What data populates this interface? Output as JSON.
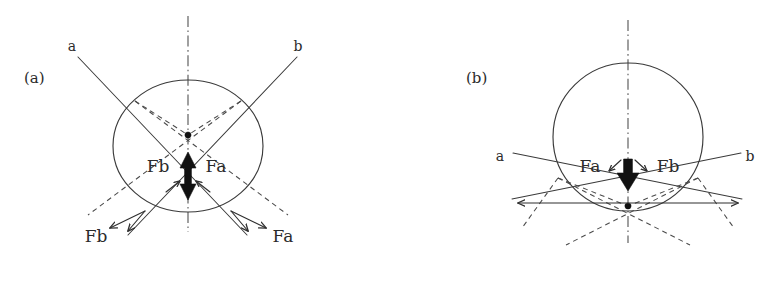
{
  "figure": {
    "background_color": "#ffffff",
    "ink_color": "#3a3a3a",
    "bold_ink_color": "#111111",
    "width": 769,
    "height": 282
  },
  "panels": [
    {
      "id": "panel-a",
      "tag": "(a)",
      "tag_position": {
        "x": 24,
        "y": 83
      },
      "circle": {
        "cx": 188,
        "cy": 146,
        "r": 66
      },
      "axis_label": "vertical-dash-dot-axis",
      "rays": [
        {
          "name": "ray-a",
          "label": "a",
          "label_position": {
            "x": 72,
            "y": 51
          }
        },
        {
          "name": "ray-b",
          "label": "b",
          "label_position": {
            "x": 298,
            "y": 51
          }
        }
      ],
      "center_forces": [
        {
          "name": "force-fb-center",
          "label": "Fb",
          "label_position": {
            "x": 158,
            "y": 172
          }
        },
        {
          "name": "force-fa-center",
          "label": "Fa",
          "label_position": {
            "x": 198,
            "y": 172
          }
        }
      ],
      "outer_forces": [
        {
          "name": "force-fb-outer",
          "label": "Fb",
          "label_position": {
            "x": 80,
            "y": 242
          }
        },
        {
          "name": "force-fa-outer",
          "label": "Fa",
          "label_position": {
            "x": 271,
            "y": 242
          }
        }
      ],
      "resultant_arrow": {
        "direction": "double-vertical",
        "style": "bold"
      },
      "focus_dot": {
        "x": 188,
        "y": 135
      }
    },
    {
      "id": "panel-b",
      "tag": "(b)",
      "tag_position": {
        "x": 466,
        "y": 83
      },
      "circle": {
        "cx": 628,
        "cy": 137,
        "r": 73
      },
      "axis_label": "vertical-dash-dot-axis",
      "rays": [
        {
          "name": "ray-a",
          "label": "a",
          "label_position": {
            "x": 500,
            "y": 161
          }
        },
        {
          "name": "ray-b",
          "label": "b",
          "label_position": {
            "x": 748,
            "y": 161
          }
        }
      ],
      "center_forces": [
        {
          "name": "force-fa-center",
          "label": "Fa",
          "label_position": {
            "x": 588,
            "y": 172
          }
        },
        {
          "name": "force-fb-center",
          "label": "Fb",
          "label_position": {
            "x": 650,
            "y": 172
          }
        }
      ],
      "outer_forces": [],
      "resultant_arrow": {
        "direction": "down",
        "style": "bold"
      },
      "horizontal_arrows": {
        "name": "horizontal-double-arrows",
        "y": 203,
        "x_left": 518,
        "x_right": 738
      },
      "focus_dot": {
        "x": 628,
        "y": 206
      }
    }
  ],
  "legend": {
    "solid_line_meaning": "incident ray",
    "dashed_line_meaning": "refracted / virtual ray",
    "dashdot_line_meaning": "optical axis"
  }
}
